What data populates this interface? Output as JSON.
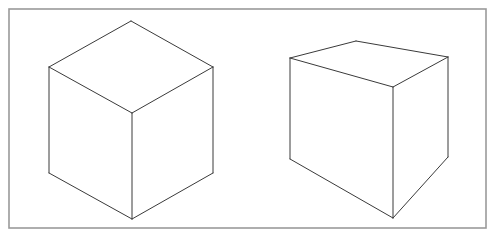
{
  "figure": {
    "width": 493,
    "height": 236,
    "background": "#ffffff",
    "frame": {
      "x": 9,
      "y": 9,
      "width": 477,
      "height": 219,
      "stroke": "#9a9a9a"
    },
    "line_color": "#3a3a3a"
  },
  "cubes": [
    {
      "name": "isometric-cube",
      "vertices": {
        "top": [
          131,
          21
        ],
        "left": [
          49,
          67
        ],
        "right": [
          213,
          67
        ],
        "center": [
          132,
          113
        ],
        "bottom": [
          132,
          219
        ],
        "bottom_left": [
          49,
          173
        ],
        "bottom_right": [
          213,
          173
        ]
      },
      "edges": [
        [
          "top",
          "left"
        ],
        [
          "top",
          "right"
        ],
        [
          "left",
          "center"
        ],
        [
          "right",
          "center"
        ],
        [
          "left",
          "bottom_left"
        ],
        [
          "right",
          "bottom_right"
        ],
        [
          "center",
          "bottom"
        ],
        [
          "bottom_left",
          "bottom"
        ],
        [
          "bottom_right",
          "bottom"
        ]
      ]
    },
    {
      "name": "perspective-cube",
      "vertices": {
        "top_left": [
          290,
          58
        ],
        "top_back": [
          356,
          41
        ],
        "top_right": [
          448,
          57
        ],
        "front_top": [
          393,
          87
        ],
        "front_bottom": [
          393,
          218
        ],
        "bottom_left": [
          290,
          159
        ],
        "bottom_right": [
          448,
          157
        ]
      },
      "edges": [
        [
          "top_left",
          "top_back"
        ],
        [
          "top_back",
          "top_right"
        ],
        [
          "top_left",
          "front_top"
        ],
        [
          "top_right",
          "front_top"
        ],
        [
          "top_left",
          "bottom_left"
        ],
        [
          "top_right",
          "bottom_right"
        ],
        [
          "front_top",
          "front_bottom"
        ],
        [
          "bottom_left",
          "front_bottom"
        ],
        [
          "bottom_right",
          "front_bottom"
        ]
      ]
    }
  ]
}
